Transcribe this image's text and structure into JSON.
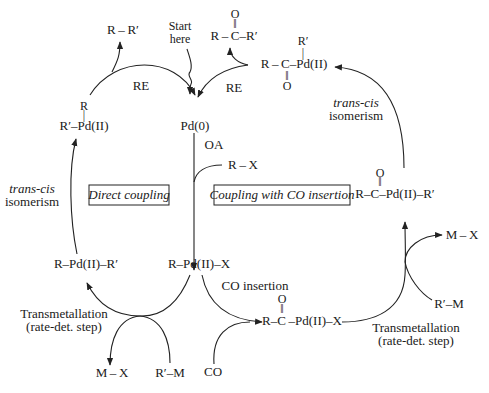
{
  "diagram": {
    "start_label": {
      "line1": "Start",
      "line2": "here"
    },
    "center": {
      "pd0": "Pd(0)"
    },
    "steps": {
      "oa": "OA",
      "re_left": "RE",
      "re_right": "RE",
      "co_insertion": "CO insertion",
      "trans_cis_left": {
        "line1": "trans-cis",
        "line2": "isomerism"
      },
      "trans_cis_right": {
        "line1": "trans-cis",
        "line2": "isomerism"
      },
      "transmetallation_left": {
        "line1": "Transmetallation",
        "line2": "(rate-det. step)"
      },
      "transmetallation_right": {
        "line1": "Transmetallation",
        "line2": "(rate-det. step)"
      }
    },
    "boxes": {
      "direct": "Direct coupling",
      "co": "Coupling with CO insertion"
    },
    "species": {
      "r_r_prime": "R – R′",
      "ketone_product": {
        "o": "O",
        "dbl": "‖",
        "main": "R – C–R′"
      },
      "acyl_pd_r_cis": {
        "top": "R′",
        "tick": "|",
        "main": "R – C–Pd(II)",
        "dbl": "‖",
        "o": "O"
      },
      "r_pd_rprime_cis": {
        "top": "R",
        "tick": "|",
        "main": "R′–Pd(II)"
      },
      "r_pd_rprime_trans": "R–Pd(II)–R′",
      "r_pd_x": "R–Pd(II)–X",
      "r_x": "R – X",
      "acyl_pd_x": {
        "o": "O",
        "dbl": "‖",
        "main": "R–C –Pd(II)–X"
      },
      "acyl_pd_rprime_trans": {
        "o": "O",
        "dbl": "‖",
        "main": "R–C–Pd(II)–R′"
      },
      "m_x_left": "M – X",
      "rprime_m_left": "R′–M",
      "co": "CO",
      "m_x_right": "M – X",
      "rprime_m_right": "R′–M"
    }
  }
}
